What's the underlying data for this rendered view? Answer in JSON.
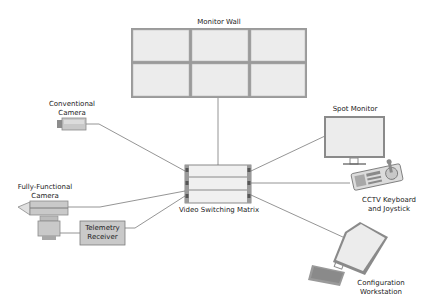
{
  "diagram": {
    "nodes": {
      "monitor_wall": {
        "label": "Monitor Wall",
        "grid": {
          "rows": 2,
          "cols": 3
        }
      },
      "conventional_camera": {
        "label": "Conventional\nCamera"
      },
      "spot_monitor": {
        "label": "Spot Monitor"
      },
      "matrix": {
        "label": "Video Switching Matrix",
        "units": 3
      },
      "fully_functional_camera": {
        "label": "Fully-Functional\nCamera"
      },
      "telemetry_receiver": {
        "label": "Telemetry\nReceiver"
      },
      "cctv_keyboard": {
        "label": "CCTV Keyboard\nand Joystick"
      },
      "workstation": {
        "label": "Configuration\nWorkstation"
      }
    },
    "edges": [
      {
        "from": "monitor_wall",
        "to": "matrix"
      },
      {
        "from": "conventional_camera",
        "to": "matrix"
      },
      {
        "from": "spot_monitor",
        "to": "matrix"
      },
      {
        "from": "fully_functional_camera",
        "to": "matrix"
      },
      {
        "from": "telemetry_receiver",
        "to": "matrix"
      },
      {
        "from": "cctv_keyboard",
        "to": "matrix"
      },
      {
        "from": "workstation",
        "to": "matrix"
      }
    ],
    "colors": {
      "screen_fill": "#eeeeee",
      "frame": "#8a8a8a",
      "line": "#777777",
      "device_fill": "#c8c8c8",
      "text": "#222222"
    }
  }
}
